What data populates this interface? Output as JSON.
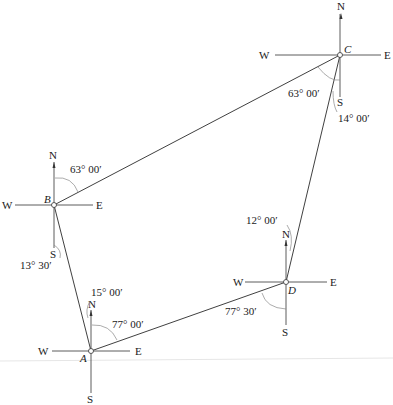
{
  "figure": {
    "type": "traverse-bearing-diagram",
    "stations": [
      {
        "id": "A",
        "label": "A",
        "x": 91,
        "y": 351
      },
      {
        "id": "B",
        "label": "B",
        "x": 54,
        "y": 205
      },
      {
        "id": "C",
        "label": "C",
        "x": 340,
        "y": 55
      },
      {
        "id": "D",
        "label": "D",
        "x": 286,
        "y": 282
      }
    ],
    "compass": {
      "north": "N",
      "south": "S",
      "east": "E",
      "west": "W"
    },
    "courses": [
      {
        "from": "A",
        "to": "B"
      },
      {
        "from": "B",
        "to": "C"
      },
      {
        "from": "C",
        "to": "D"
      },
      {
        "from": "D",
        "to": "A"
      }
    ],
    "angles": {
      "B_north": "63° 00′",
      "B_south": "13° 30′",
      "C_south_west": "63° 00′",
      "C_south": "14° 00′",
      "D_north": "12° 00′",
      "D_south_west": "77° 30′",
      "A_north": "15° 00′",
      "A_north_east": "77° 00′"
    }
  }
}
